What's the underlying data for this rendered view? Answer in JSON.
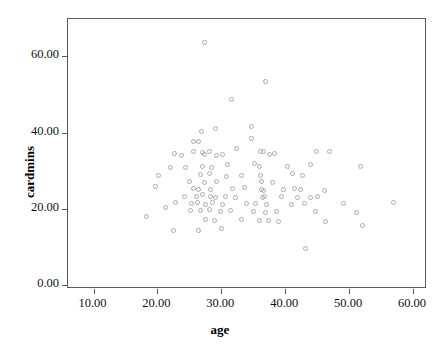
{
  "chart_data": {
    "type": "scatter",
    "title": "",
    "xlabel": "age",
    "ylabel": "cardmins",
    "xlim": [
      6.0,
      62.2
    ],
    "ylim": [
      -0.8,
      70.1
    ],
    "xticks": [
      "10.00",
      "20.00",
      "30.00",
      "40.00",
      "50.00",
      "60.00"
    ],
    "xtick_values": [
      10,
      20,
      30,
      40,
      50,
      60
    ],
    "yticks": [
      "0.00",
      "20.00",
      "40.00",
      "60.00"
    ],
    "ytick_values": [
      0,
      20,
      40,
      60
    ],
    "grid": false,
    "legend": null,
    "marker": {
      "shape": "open-circle",
      "color": "#a9a9b0",
      "size": 5
    },
    "n_points": 108,
    "points": [
      [
        27.3,
        63.9
      ],
      [
        36.9,
        53.8
      ],
      [
        31.6,
        49.0
      ],
      [
        34.8,
        42.0
      ],
      [
        26.9,
        40.6
      ],
      [
        29.1,
        41.3
      ],
      [
        25.6,
        38.0
      ],
      [
        26.4,
        38.0
      ],
      [
        34.8,
        38.6
      ],
      [
        32.4,
        36.2
      ],
      [
        22.6,
        34.8
      ],
      [
        23.7,
        34.3
      ],
      [
        25.6,
        35.4
      ],
      [
        27.1,
        35.1
      ],
      [
        27.3,
        34.5
      ],
      [
        28.1,
        35.2
      ],
      [
        29.3,
        34.3
      ],
      [
        30.2,
        34.6
      ],
      [
        36.1,
        35.3
      ],
      [
        36.6,
        35.2
      ],
      [
        37.5,
        34.5
      ],
      [
        38.3,
        34.8
      ],
      [
        44.9,
        35.2
      ],
      [
        47.0,
        35.3
      ],
      [
        22.1,
        31.2
      ],
      [
        24.4,
        31.0
      ],
      [
        27.1,
        31.3
      ],
      [
        28.4,
        31.0
      ],
      [
        31.0,
        32.0
      ],
      [
        35.2,
        32.2
      ],
      [
        36.0,
        31.3
      ],
      [
        40.3,
        31.3
      ],
      [
        43.9,
        32.0
      ],
      [
        51.8,
        31.5
      ],
      [
        20.1,
        29.0
      ],
      [
        26.8,
        29.2
      ],
      [
        28.1,
        29.6
      ],
      [
        30.8,
        28.8
      ],
      [
        33.2,
        29.0
      ],
      [
        36.1,
        28.9
      ],
      [
        41.1,
        29.5
      ],
      [
        42.7,
        29.0
      ],
      [
        36.3,
        27.3
      ],
      [
        38.0,
        27.2
      ],
      [
        25.0,
        27.3
      ],
      [
        27.4,
        27.1
      ],
      [
        29.2,
        27.4
      ],
      [
        19.7,
        26.0
      ],
      [
        25.7,
        25.6
      ],
      [
        26.5,
        25.4
      ],
      [
        28.3,
        25.2
      ],
      [
        31.8,
        25.5
      ],
      [
        33.6,
        25.8
      ],
      [
        36.3,
        25.4
      ],
      [
        36.6,
        25.1
      ],
      [
        39.8,
        25.2
      ],
      [
        41.5,
        25.5
      ],
      [
        42.4,
        25.3
      ],
      [
        46.1,
        25.0
      ],
      [
        24.2,
        23.6
      ],
      [
        26.1,
        23.4
      ],
      [
        27.0,
        23.9
      ],
      [
        28.3,
        23.6
      ],
      [
        29.1,
        23.2
      ],
      [
        30.6,
        23.5
      ],
      [
        32.2,
        23.2
      ],
      [
        36.4,
        23.3
      ],
      [
        36.8,
        23.6
      ],
      [
        39.4,
        23.4
      ],
      [
        42.0,
        23.3
      ],
      [
        44.0,
        23.2
      ],
      [
        45.0,
        23.4
      ],
      [
        22.9,
        22.0
      ],
      [
        25.4,
        21.6
      ],
      [
        26.2,
        21.9
      ],
      [
        27.5,
        21.5
      ],
      [
        28.6,
        21.8
      ],
      [
        30.2,
        21.4
      ],
      [
        33.9,
        21.6
      ],
      [
        35.3,
        21.7
      ],
      [
        37.1,
        21.3
      ],
      [
        41.0,
        21.5
      ],
      [
        43.1,
        21.6
      ],
      [
        49.1,
        21.7
      ],
      [
        56.9,
        21.8
      ],
      [
        21.3,
        20.5
      ],
      [
        25.1,
        19.8
      ],
      [
        26.8,
        19.7
      ],
      [
        28.1,
        20.0
      ],
      [
        29.8,
        19.6
      ],
      [
        31.5,
        19.8
      ],
      [
        35.0,
        19.5
      ],
      [
        36.9,
        19.4
      ],
      [
        38.6,
        19.6
      ],
      [
        44.8,
        19.6
      ],
      [
        51.2,
        19.4
      ],
      [
        18.3,
        18.3
      ],
      [
        27.6,
        17.5
      ],
      [
        29.0,
        17.2
      ],
      [
        33.1,
        17.4
      ],
      [
        36.0,
        17.2
      ],
      [
        37.4,
        17.3
      ],
      [
        39.0,
        17.0
      ],
      [
        46.3,
        16.9
      ],
      [
        52.1,
        15.8
      ],
      [
        22.5,
        14.6
      ],
      [
        26.4,
        14.5
      ],
      [
        30.0,
        15.1
      ],
      [
        43.2,
        9.8
      ]
    ]
  }
}
